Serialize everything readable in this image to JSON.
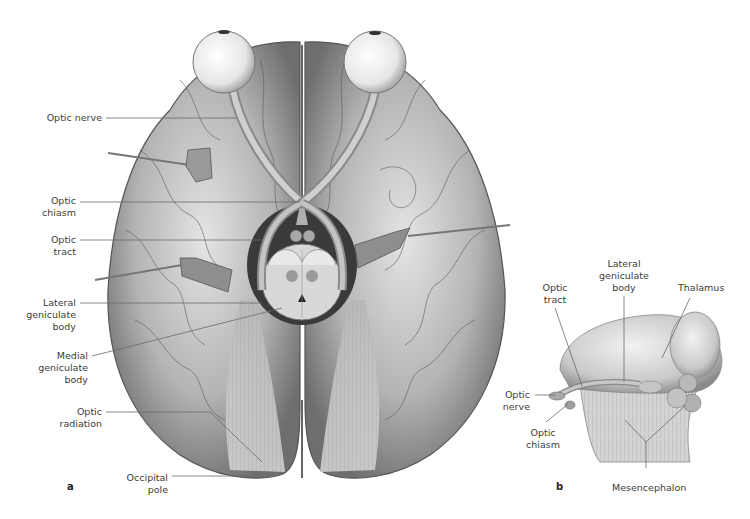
{
  "figure": {
    "panel_a": {
      "letter": "a",
      "labels": {
        "optic_nerve": "Optic nerve",
        "optic_chiasm_1": "Optic",
        "optic_chiasm_2": "chiasm",
        "optic_tract_1": "Optic",
        "optic_tract_2": "tract",
        "lateral_geniculate_1": "Lateral",
        "lateral_geniculate_2": "geniculate",
        "lateral_geniculate_3": "body",
        "medial_geniculate_1": "Medial",
        "medial_geniculate_2": "geniculate",
        "medial_geniculate_3": "body",
        "optic_radiation_1": "Optic",
        "optic_radiation_2": "radiation",
        "occipital_pole_1": "Occipital",
        "occipital_pole_2": "pole"
      }
    },
    "panel_b": {
      "letter": "b",
      "labels": {
        "optic_tract_1": "Optic",
        "optic_tract_2": "tract",
        "lateral_geniculate_1": "Lateral",
        "lateral_geniculate_2": "geniculate",
        "lateral_geniculate_3": "body",
        "thalamus": "Thalamus",
        "optic_nerve_1": "Optic",
        "optic_nerve_2": "nerve",
        "optic_chiasm_1": "Optic",
        "optic_chiasm_2": "chiasm",
        "mesencephalon": "Mesencephalon"
      }
    },
    "colors": {
      "background": "#ffffff",
      "brain_light": "#d8d8d8",
      "brain_mid": "#a9a9a9",
      "brain_dark": "#4a4a4a",
      "leader_line": "#6a6a6a",
      "text": "#3c3c3c"
    }
  }
}
